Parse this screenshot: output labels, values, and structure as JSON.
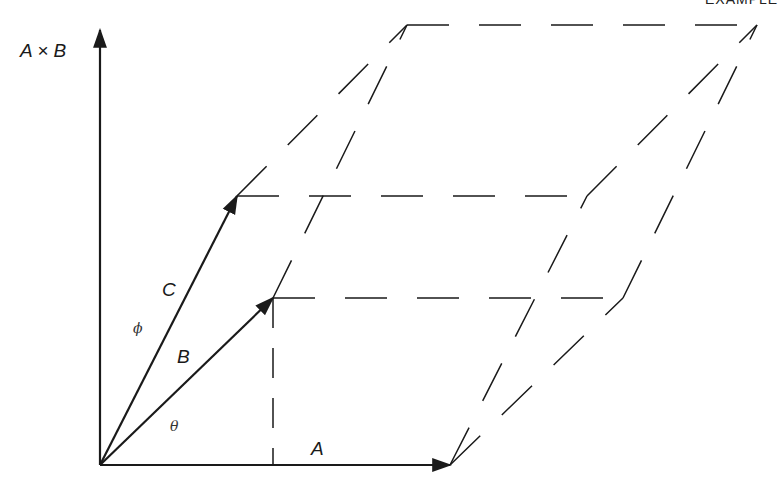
{
  "header": {
    "text": "EXAMPLE"
  },
  "labels": {
    "axis": "A × B",
    "vec_a": "A",
    "vec_b": "B",
    "vec_c": "C",
    "theta": "θ",
    "phi": "ϕ"
  },
  "geometry": {
    "origin": [
      100,
      465
    ],
    "a_tip": [
      450,
      465
    ],
    "b_tip": [
      273,
      298
    ],
    "c_tip": [
      237,
      196
    ],
    "a_plus_b": [
      623,
      298
    ],
    "a_plus_c": [
      587,
      196
    ],
    "b_plus_c": [
      407,
      25
    ],
    "a_plus_b_plus_c": [
      757,
      25
    ],
    "axis_top": [
      100,
      28
    ]
  },
  "colors": {
    "ink": "#1a1a1a"
  }
}
